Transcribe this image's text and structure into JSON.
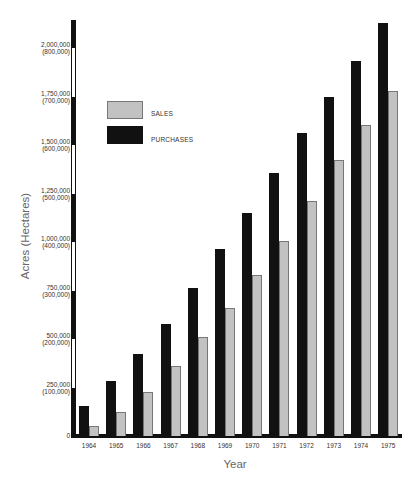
{
  "chart_data": {
    "type": "bar",
    "title": "",
    "xlabel": "Year",
    "ylabel": "Acres (Hectares)",
    "categories": [
      "1964",
      "1965",
      "1966",
      "1967",
      "1968",
      "1969",
      "1970",
      "1971",
      "1972",
      "1973",
      "1974",
      "1975"
    ],
    "series": [
      {
        "name": "PURCHASES",
        "color": "#111111",
        "values": [
          155000,
          283000,
          423000,
          577000,
          763000,
          964000,
          1149000,
          1356000,
          1562000,
          1747000,
          1933000,
          2129000
        ]
      },
      {
        "name": "SALES",
        "color": "#c2c2c2",
        "values": [
          52000,
          124000,
          227000,
          361000,
          510000,
          660000,
          830000,
          1005000,
          1211000,
          1423000,
          1603000,
          1778000
        ]
      }
    ],
    "yticks": [
      {
        "value": 0,
        "acres": "0",
        "hectares": ""
      },
      {
        "value": 250000,
        "acres": "250,000",
        "hectares": "(100,000)"
      },
      {
        "value": 500000,
        "acres": "500,000",
        "hectares": "(200,000)"
      },
      {
        "value": 750000,
        "acres": "750,000",
        "hectares": "(300,000)"
      },
      {
        "value": 1000000,
        "acres": "1,000,000",
        "hectares": "(400,000)"
      },
      {
        "value": 1250000,
        "acres": "1,250,000",
        "hectares": "(500,000)"
      },
      {
        "value": 1500000,
        "acres": "1,500,000",
        "hectares": "(600,000)"
      },
      {
        "value": 1750000,
        "acres": "1,750,000",
        "hectares": "(700,000)"
      },
      {
        "value": 2000000,
        "acres": "2,000,000",
        "hectares": "(800,000)"
      }
    ],
    "ylim": [
      0,
      2150000
    ],
    "grid": false,
    "legend": {
      "position": "upper-left inside",
      "entries": [
        "SALES",
        "PURCHASES"
      ]
    }
  },
  "legend": {
    "sales_label": "SALES",
    "purchases_label": "PURCHASES"
  },
  "axes": {
    "x_title": "Year",
    "y_title": "Acres (Hectares)"
  }
}
